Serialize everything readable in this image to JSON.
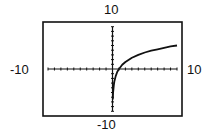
{
  "chart_data": {
    "type": "line",
    "title": "",
    "xlabel": "",
    "ylabel": "",
    "xlim": [
      -10,
      10
    ],
    "ylim": [
      -10,
      10
    ],
    "xticks_step": 1,
    "yticks_step": 1,
    "grid": false,
    "window_labels": {
      "ymax": "10",
      "ymin": "-10",
      "xmin": "-10",
      "xmax": "10"
    },
    "series": [
      {
        "name": "f(x)",
        "x": [
          0.05,
          0.1,
          0.2,
          0.3,
          0.5,
          0.75,
          1,
          1.5,
          2,
          3,
          4,
          5,
          6,
          7,
          8,
          9,
          10
        ],
        "y": [
          -6.5,
          -5.0,
          -3.5,
          -2.6,
          -1.5,
          -0.6,
          0,
          0.9,
          1.5,
          2.4,
          3.0,
          3.5,
          3.9,
          4.2,
          4.5,
          4.8,
          5.0
        ]
      }
    ]
  }
}
